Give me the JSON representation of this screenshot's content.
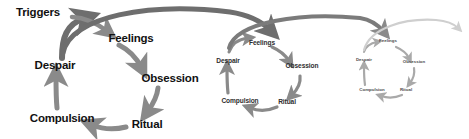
{
  "diagram": {
    "background_color": "#ffffff",
    "stages": [
      "Triggers",
      "Feelings",
      "Obsession",
      "Ritual",
      "Compulsion",
      "Despair"
    ],
    "colors": {
      "text_dark": "#111111",
      "arrow_dark": "#6e6e6e",
      "arrow_mid": "#8a8a8a",
      "arrow_light": "#b8b8b8",
      "arrow_faint": "#d2d2d2"
    },
    "cycles": [
      {
        "id": "cycle-1",
        "scale": "large",
        "labels": {
          "triggers": "Triggers",
          "feelings": "Feelings",
          "obsession": "Obsession",
          "ritual": "Ritual",
          "compulsion": "Compulsion",
          "despair": "Despair"
        }
      },
      {
        "id": "cycle-2",
        "scale": "medium",
        "labels": {
          "feelings": "Feelings",
          "obsession": "Obsession",
          "ritual": "Ritual",
          "compulsion": "Compulsion",
          "despair": "Despair"
        }
      },
      {
        "id": "cycle-3",
        "scale": "small",
        "labels": {
          "feelings": "Feelings",
          "obsession": "Obsession",
          "ritual": "Ritual",
          "compulsion": "Compulsion",
          "despair": "Despair"
        }
      }
    ],
    "connectors": [
      {
        "id": "link-1-to-2",
        "from": "cycle-1",
        "to": "cycle-2",
        "shade": "dark"
      },
      {
        "id": "link-2-to-3",
        "from": "cycle-2",
        "to": "cycle-3",
        "shade": "mid"
      },
      {
        "id": "link-3-to-next",
        "from": "cycle-3",
        "to": "offscreen",
        "shade": "faint"
      }
    ]
  }
}
